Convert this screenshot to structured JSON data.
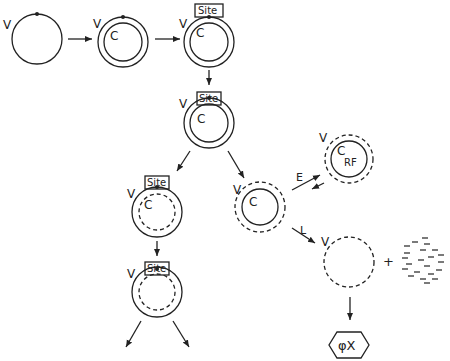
{
  "diagram": {
    "labels": {
      "viral_strand": "V",
      "complementary_strand": "C",
      "site": "Site",
      "replicative_form": "RF",
      "early_path": "E",
      "late_path": "L",
      "plus": "+",
      "phage": "φX"
    },
    "nodes": [
      {
        "id": "ss-viral",
        "description": "single-stranded viral circle with site dot",
        "labels": [
          "V"
        ]
      },
      {
        "id": "rf-initial",
        "description": "double circle V/C with dot",
        "labels": [
          "V",
          "C"
        ]
      },
      {
        "id": "rf-site-1",
        "description": "double circle with Site box",
        "labels": [
          "V",
          "C",
          "Site"
        ]
      },
      {
        "id": "rf-site-2",
        "description": "double circle with Site box",
        "labels": [
          "V",
          "C",
          "Site"
        ]
      },
      {
        "id": "rf-site-dashedC",
        "description": "solid V, dashed C with Site box",
        "labels": [
          "V",
          "C",
          "Site"
        ]
      },
      {
        "id": "rf-site-dashedC-2",
        "description": "solid V, dashed C with Site box, branching",
        "labels": [
          "V",
          "Site"
        ]
      },
      {
        "id": "dashedV-solidC",
        "description": "dashed V, solid C",
        "labels": [
          "V",
          "C"
        ]
      },
      {
        "id": "rf-replicative",
        "description": "dashed V, solid C replicative form",
        "labels": [
          "V",
          "C",
          "RF"
        ]
      },
      {
        "id": "dashed-v-only",
        "description": "dashed viral circle",
        "labels": [
          "V"
        ]
      },
      {
        "id": "fragments",
        "description": "scattered short strands",
        "labels": []
      },
      {
        "id": "phage",
        "description": "hexagon phage particle",
        "labels": [
          "φX"
        ]
      }
    ],
    "edges": [
      {
        "from": "ss-viral",
        "to": "rf-initial"
      },
      {
        "from": "rf-initial",
        "to": "rf-site-1"
      },
      {
        "from": "rf-site-1",
        "to": "rf-site-2"
      },
      {
        "from": "rf-site-2",
        "to": "rf-site-dashedC"
      },
      {
        "from": "rf-site-2",
        "to": "dashedV-solidC"
      },
      {
        "from": "rf-site-dashedC",
        "to": "rf-site-dashedC-2"
      },
      {
        "from": "dashedV-solidC",
        "to": "rf-replicative",
        "label": "E",
        "bidirectional": true
      },
      {
        "from": "dashedV-solidC",
        "to": "dashed-v-only",
        "label": "L"
      },
      {
        "from": "dashed-v-only",
        "to": "phage"
      }
    ]
  }
}
